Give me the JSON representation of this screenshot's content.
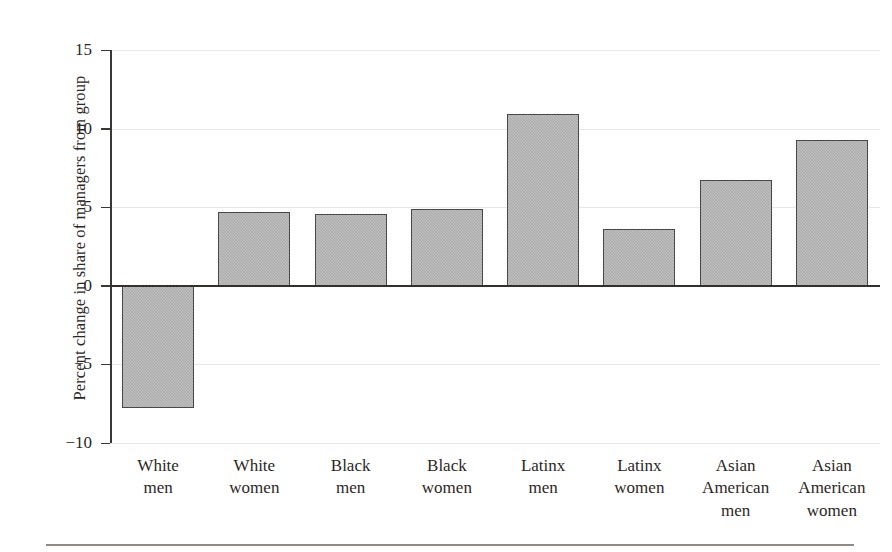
{
  "chart_data": {
    "type": "bar",
    "title": "",
    "subtitle": "",
    "xlabel": "",
    "ylabel": "Percent change in share of managers from group",
    "categories": [
      "White men",
      "White women",
      "Black men",
      "Black women",
      "Latinx men",
      "Latinx women",
      "Asian American men",
      "Asian American women"
    ],
    "category_lines": [
      [
        "White",
        "men"
      ],
      [
        "White",
        "women"
      ],
      [
        "Black",
        "men"
      ],
      [
        "Black",
        "women"
      ],
      [
        "Latinx",
        "men"
      ],
      [
        "Latinx",
        "women"
      ],
      [
        "Asian",
        "American",
        "men"
      ],
      [
        "Asian",
        "American",
        "women"
      ]
    ],
    "values": [
      -7.8,
      4.7,
      4.55,
      4.9,
      10.9,
      3.6,
      6.7,
      9.25
    ],
    "ylim": [
      -10,
      15
    ],
    "yticks": [
      15,
      10,
      5,
      0,
      -5,
      -10
    ],
    "ytick_labels": [
      "15",
      "10",
      "5",
      "0",
      "−5",
      "−10"
    ],
    "grid": true,
    "grid_axis": "y",
    "legend": null,
    "bar_fill": "#a9a9a9",
    "bar_edge": "#4a4745",
    "axis_color": "#332f2c",
    "grid_color": "#e9e7e4",
    "text_color": "#2b2724"
  }
}
